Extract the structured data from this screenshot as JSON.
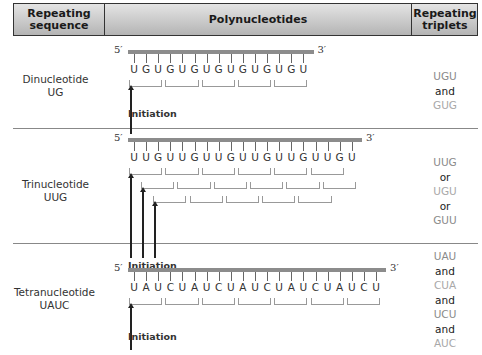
{
  "header": {
    "col1": "Repeating sequence",
    "col1_l1": "Repeating",
    "col1_l2": "sequence",
    "col2": "Polynucleotides",
    "col3_l1": "Repeating",
    "col3_l2": "triplets"
  },
  "rows": [
    {
      "name_l1": "Dinucleotide",
      "name_l2": "UG",
      "five_prime": "5′",
      "three_prime": "3′",
      "sequence": [
        "U",
        "G",
        "U",
        "G",
        "U",
        "G",
        "U",
        "G",
        "U",
        "G",
        "U",
        "G",
        "U",
        "G",
        "U"
      ],
      "initiation": "Initiation",
      "triplets": [
        "UGU",
        "and",
        "GUG"
      ]
    },
    {
      "name_l1": "Trinucleotide",
      "name_l2": "UUG",
      "five_prime": "5′",
      "three_prime": "3′",
      "sequence": [
        "U",
        "U",
        "G",
        "U",
        "U",
        "G",
        "U",
        "U",
        "G",
        "U",
        "U",
        "G",
        "U",
        "U",
        "G",
        "U",
        "U",
        "G",
        "U"
      ],
      "initiation": "Initiation",
      "triplets": [
        "UUG",
        "or",
        "UGU",
        "or",
        "GUU"
      ]
    },
    {
      "name_l1": "Tetranucleotide",
      "name_l2": "UAUC",
      "five_prime": "5′",
      "three_prime": "3′",
      "sequence": [
        "U",
        "A",
        "U",
        "C",
        "U",
        "A",
        "U",
        "C",
        "U",
        "A",
        "U",
        "C",
        "U",
        "A",
        "U",
        "C",
        "U",
        "A",
        "U",
        "C",
        "U"
      ],
      "initiation": "Initiation",
      "triplets": [
        "UAU",
        "and",
        "CUA",
        "and",
        "UCU",
        "and",
        "AUC"
      ]
    }
  ],
  "colors": {
    "bar": "#8c8c8c",
    "triplet_text": "#8a8a8a",
    "header_bg": "#c8c8c8"
  }
}
